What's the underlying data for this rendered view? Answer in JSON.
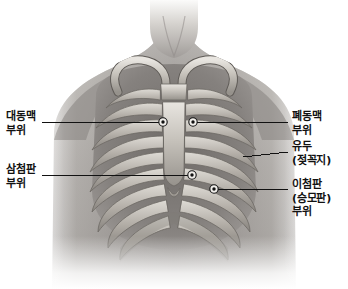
{
  "figure": {
    "orientation": "anterior chest wall with rib cage overlay",
    "background_color": "#ffffff",
    "line_color": "#1a1a1a",
    "text_color": "#111111",
    "width": 348,
    "height": 289
  },
  "labels": {
    "aortic": {
      "lines": [
        "대동맥",
        "부위"
      ],
      "side": "left"
    },
    "tricuspid": {
      "lines": [
        "삼첨판",
        "부위"
      ],
      "side": "left"
    },
    "pulmonic": {
      "lines": [
        "폐동맥",
        "부위"
      ],
      "side": "right"
    },
    "nipple": {
      "lines": [
        "유두",
        "(젖꼭지)"
      ],
      "side": "right"
    },
    "mitral": {
      "lines": [
        "이첨판",
        "(승모판)",
        "부위"
      ],
      "side": "right"
    }
  },
  "markers": [
    {
      "name": "aortic-marker",
      "x": 163,
      "y": 122
    },
    {
      "name": "pulmonic-marker",
      "x": 193,
      "y": 122
    },
    {
      "name": "tricuspid-marker",
      "x": 192,
      "y": 175
    },
    {
      "name": "mitral-marker",
      "x": 214,
      "y": 189
    }
  ],
  "leader_lines": [
    {
      "name": "aortic-leader",
      "x1": 42,
      "y1": 122,
      "x2": 160,
      "y2": 122
    },
    {
      "name": "pulmonic-leader",
      "x1": 196,
      "y1": 122,
      "x2": 288,
      "y2": 122
    },
    {
      "name": "tricuspid-leader",
      "x1": 42,
      "y1": 175,
      "x2": 189,
      "y2": 175
    },
    {
      "name": "nipple-leader",
      "x1": 243,
      "y1": 156,
      "x2": 288,
      "y2": 152
    },
    {
      "name": "mitral-leader",
      "x1": 217,
      "y1": 189,
      "x2": 288,
      "y2": 190
    }
  ]
}
